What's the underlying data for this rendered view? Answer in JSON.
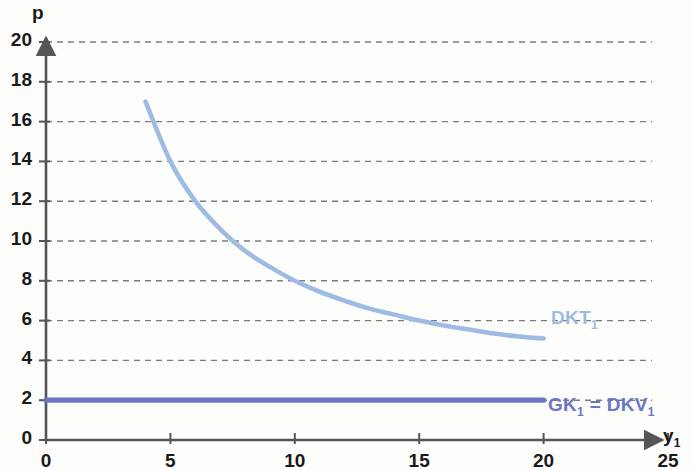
{
  "chart_data": {
    "type": "line",
    "title": "",
    "xlabel": "y₁",
    "ylabel": "p",
    "xlim": [
      0,
      25
    ],
    "ylim": [
      0,
      20
    ],
    "xticks": [
      0,
      5,
      10,
      15,
      20,
      25
    ],
    "yticks": [
      0,
      2,
      4,
      6,
      8,
      10,
      12,
      14,
      16,
      18,
      20
    ],
    "grid": "horizontal-dashed",
    "legend": "inline-right",
    "series": [
      {
        "name": "DKT₁",
        "label_base": "DKT",
        "label_sub": "1",
        "color": "#9dbbe3",
        "kind": "curve",
        "x": [
          4,
          5,
          6,
          7,
          8,
          9,
          10,
          11,
          12,
          13,
          14,
          15,
          16,
          17,
          18,
          19,
          20
        ],
        "y": [
          17.0,
          14.0,
          12.0,
          10.6,
          9.5,
          8.7,
          8.0,
          7.45,
          7.0,
          6.6,
          6.3,
          6.0,
          5.75,
          5.55,
          5.35,
          5.2,
          5.1
        ]
      },
      {
        "name": "GK₁ = DKV₁",
        "label_base": "GK",
        "label_sub": "1",
        "label_base2": " = DKV",
        "label_sub2": "1",
        "color": "#6b77c4",
        "kind": "horizontal",
        "x": [
          0,
          20
        ],
        "y": [
          2,
          2
        ]
      }
    ]
  },
  "axes": {
    "y_title": "p",
    "x_title_base": "y",
    "x_title_sub": "1"
  },
  "labels": {
    "dkt_base": "DKT",
    "dkt_sub": "1",
    "gk_text_a": "GK",
    "gk_sub_a": "1",
    "gk_text_b": " = DKV",
    "gk_sub_b": "1"
  },
  "colors": {
    "dkt": "#9dbbe3",
    "gk": "#6b77c4",
    "axis": "#555555",
    "grid": "#666666",
    "text": "#1a1a1a",
    "background": "#fdfdfc"
  }
}
